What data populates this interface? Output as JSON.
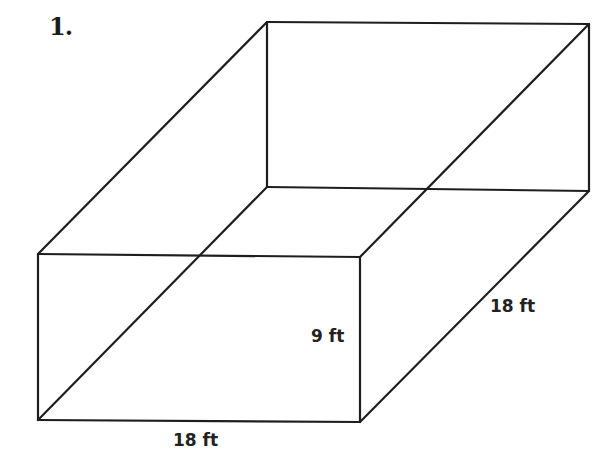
{
  "problem": {
    "number_label": "1."
  },
  "figure": {
    "shape": "rectangular prism",
    "style": "wireframe",
    "line_color": "#1e1e1e",
    "background": "#ffffff",
    "dimensions": {
      "width": "18 ft",
      "height": "9 ft",
      "depth": "18 ft"
    },
    "vertices": {
      "front_top_left": [
        38,
        254
      ],
      "front_top_right": [
        360,
        257
      ],
      "front_bottom_right": [
        360,
        422
      ],
      "front_bottom_left": [
        38,
        420
      ],
      "back_top_left": [
        267,
        22
      ],
      "back_top_right": [
        589,
        24
      ],
      "back_bottom_right": [
        589,
        191
      ],
      "back_bottom_left": [
        267,
        187
      ]
    }
  }
}
